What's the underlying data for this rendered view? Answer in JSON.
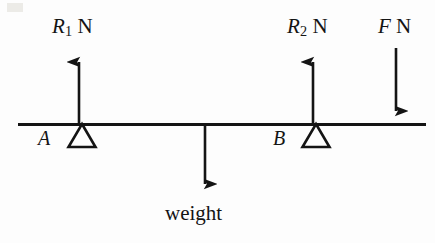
{
  "diagram": {
    "background_color": "#fdfdfd",
    "stroke_color": "#141414",
    "beam": {
      "label": "beam",
      "x1": 18,
      "y": 124,
      "x2": 426,
      "thickness": 3
    },
    "supports": [
      {
        "name": "support-a",
        "label": "A",
        "x": 82,
        "apex_y": 124,
        "base_y": 147,
        "half_width": 13
      },
      {
        "name": "support-b",
        "label": "B",
        "x": 316,
        "apex_y": 124,
        "base_y": 147,
        "half_width": 13
      }
    ],
    "forces": [
      {
        "name": "reaction-r1",
        "symbol": "R",
        "subscript": "1",
        "unit": "N",
        "label": "R1 N",
        "direction": "up",
        "x": 79,
        "tail_y": 124,
        "head_y": 49
      },
      {
        "name": "reaction-r2",
        "symbol": "R",
        "subscript": "2",
        "unit": "N",
        "label": "R2 N",
        "direction": "up",
        "x": 313,
        "tail_y": 124,
        "head_y": 49
      },
      {
        "name": "applied-force-f",
        "symbol": "F",
        "subscript": "",
        "unit": "N",
        "label": "F N",
        "direction": "down",
        "x": 396,
        "tail_y": 48,
        "head_y": 124
      },
      {
        "name": "weight-force",
        "symbol": "",
        "subscript": "",
        "unit": "",
        "label": "weight",
        "direction": "down",
        "x": 205,
        "tail_y": 124,
        "head_y": 197
      }
    ]
  },
  "labels": {
    "r1_symbol": "R",
    "r1_subscript": "1",
    "r1_unit": "N",
    "r2_symbol": "R",
    "r2_subscript": "2",
    "r2_unit": "N",
    "f_symbol": "F",
    "f_unit": "N",
    "support_a": "A",
    "support_b": "B",
    "weight": "weight"
  }
}
